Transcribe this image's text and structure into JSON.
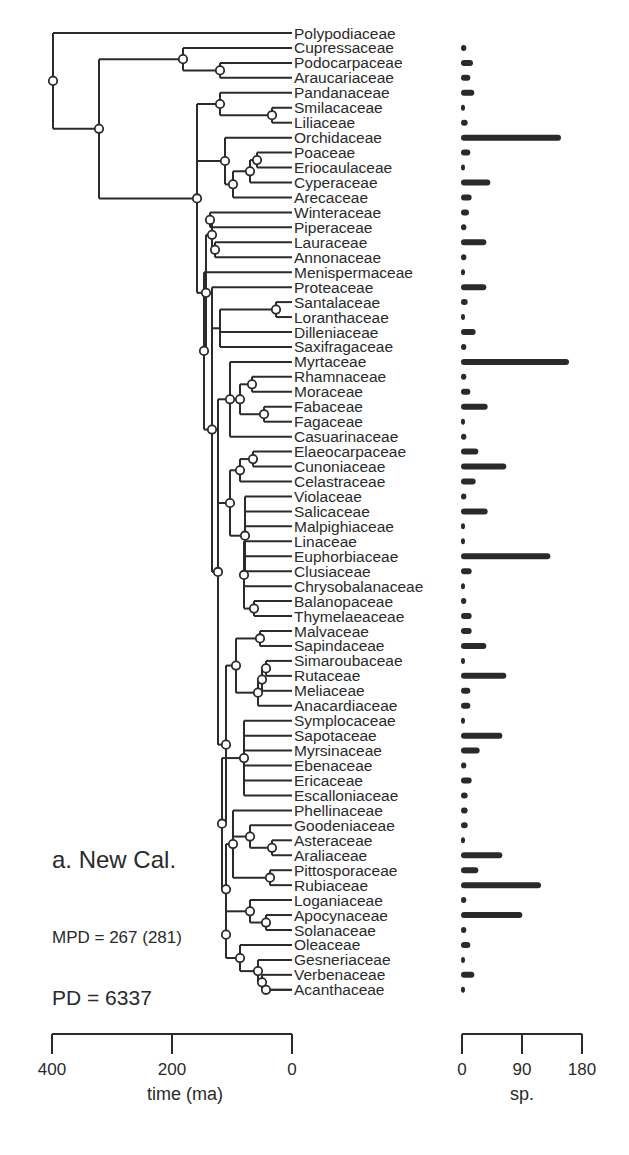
{
  "panel_label": "a. New Cal.",
  "stats": {
    "mpd": "MPD = 267 (281)",
    "pd": "PD = 6337"
  },
  "chart_data": [
    {
      "type": "dendrogram",
      "title": "a. New Cal.",
      "xlabel": "time (ma)",
      "xlim": [
        400,
        0
      ],
      "xticks": [
        "400",
        "200",
        "0"
      ],
      "annotations": [
        "MPD = 267 (281)",
        "PD = 6337"
      ],
      "leaves": [
        "Polypodiaceae",
        "Cupressaceae",
        "Podocarpaceae",
        "Araucariaceae",
        "Pandanaceae",
        "Smilacaceae",
        "Liliaceae",
        "Orchidaceae",
        "Poaceae",
        "Eriocaulaceae",
        "Cyperaceae",
        "Arecaceae",
        "Winteraceae",
        "Piperaceae",
        "Lauraceae",
        "Annonaceae",
        "Menispermaceae",
        "Proteaceae",
        "Santalaceae",
        "Loranthaceae",
        "Dilleniaceae",
        "Saxifragaceae",
        "Myrtaceae",
        "Rhamnaceae",
        "Moraceae",
        "Fabaceae",
        "Fagaceae",
        "Casuarinaceae",
        "Elaeocarpaceae",
        "Cunoniaceae",
        "Celastraceae",
        "Violaceae",
        "Salicaceae",
        "Malpighiaceae",
        "Linaceae",
        "Euphorbiaceae",
        "Clusiaceae",
        "Chrysobalanaceae",
        "Balanopaceae",
        "Thymelaeaceae",
        "Malvaceae",
        "Sapindaceae",
        "Simaroubaceae",
        "Rutaceae",
        "Meliaceae",
        "Anacardiaceae",
        "Symplocaceae",
        "Sapotaceae",
        "Myrsinaceae",
        "Ebenaceae",
        "Ericaceae",
        "Escalloniaceae",
        "Phellinaceae",
        "Goodeniaceae",
        "Asteraceae",
        "Araliaceae",
        "Pittosporaceae",
        "Rubiaceae",
        "Loganiaceae",
        "Apocynaceae",
        "Solanaceae",
        "Oleaceae",
        "Gesneriaceae",
        "Verbenaceae",
        "Acanthaceae"
      ]
    },
    {
      "type": "bar",
      "orientation": "horizontal",
      "xlabel": "sp.",
      "xlim": [
        0,
        180
      ],
      "xticks": [
        "0",
        "90",
        "180"
      ],
      "categories": [
        "Polypodiaceae",
        "Cupressaceae",
        "Podocarpaceae",
        "Araucariaceae",
        "Pandanaceae",
        "Smilacaceae",
        "Liliaceae",
        "Orchidaceae",
        "Poaceae",
        "Eriocaulaceae",
        "Cyperaceae",
        "Arecaceae",
        "Winteraceae",
        "Piperaceae",
        "Lauraceae",
        "Annonaceae",
        "Menispermaceae",
        "Proteaceae",
        "Santalaceae",
        "Loranthaceae",
        "Dilleniaceae",
        "Saxifragaceae",
        "Myrtaceae",
        "Rhamnaceae",
        "Moraceae",
        "Fabaceae",
        "Fagaceae",
        "Casuarinaceae",
        "Elaeocarpaceae",
        "Cunoniaceae",
        "Celastraceae",
        "Violaceae",
        "Salicaceae",
        "Malpighiaceae",
        "Linaceae",
        "Euphorbiaceae",
        "Clusiaceae",
        "Chrysobalanaceae",
        "Balanopaceae",
        "Thymelaeaceae",
        "Malvaceae",
        "Sapindaceae",
        "Simaroubaceae",
        "Rutaceae",
        "Meliaceae",
        "Anacardiaceae",
        "Symplocaceae",
        "Sapotaceae",
        "Myrsinaceae",
        "Ebenaceae",
        "Ericaceae",
        "Escalloniaceae",
        "Phellinaceae",
        "Goodeniaceae",
        "Asteraceae",
        "Araliaceae",
        "Pittosporaceae",
        "Rubiaceae",
        "Loganiaceae",
        "Apocynaceae",
        "Solanaceae",
        "Oleaceae",
        "Gesneriaceae",
        "Verbenaceae",
        "Acanthaceae"
      ],
      "values": [
        0,
        8,
        18,
        14,
        20,
        6,
        10,
        150,
        14,
        5,
        44,
        16,
        12,
        8,
        38,
        8,
        6,
        38,
        10,
        5,
        22,
        8,
        162,
        8,
        14,
        40,
        6,
        8,
        26,
        68,
        22,
        8,
        40,
        5,
        4,
        134,
        16,
        4,
        8,
        16,
        16,
        38,
        6,
        68,
        14,
        14,
        4,
        62,
        28,
        8,
        16,
        10,
        10,
        10,
        6,
        62,
        26,
        120,
        8,
        92,
        8,
        14,
        6,
        20,
        6
      ]
    }
  ]
}
